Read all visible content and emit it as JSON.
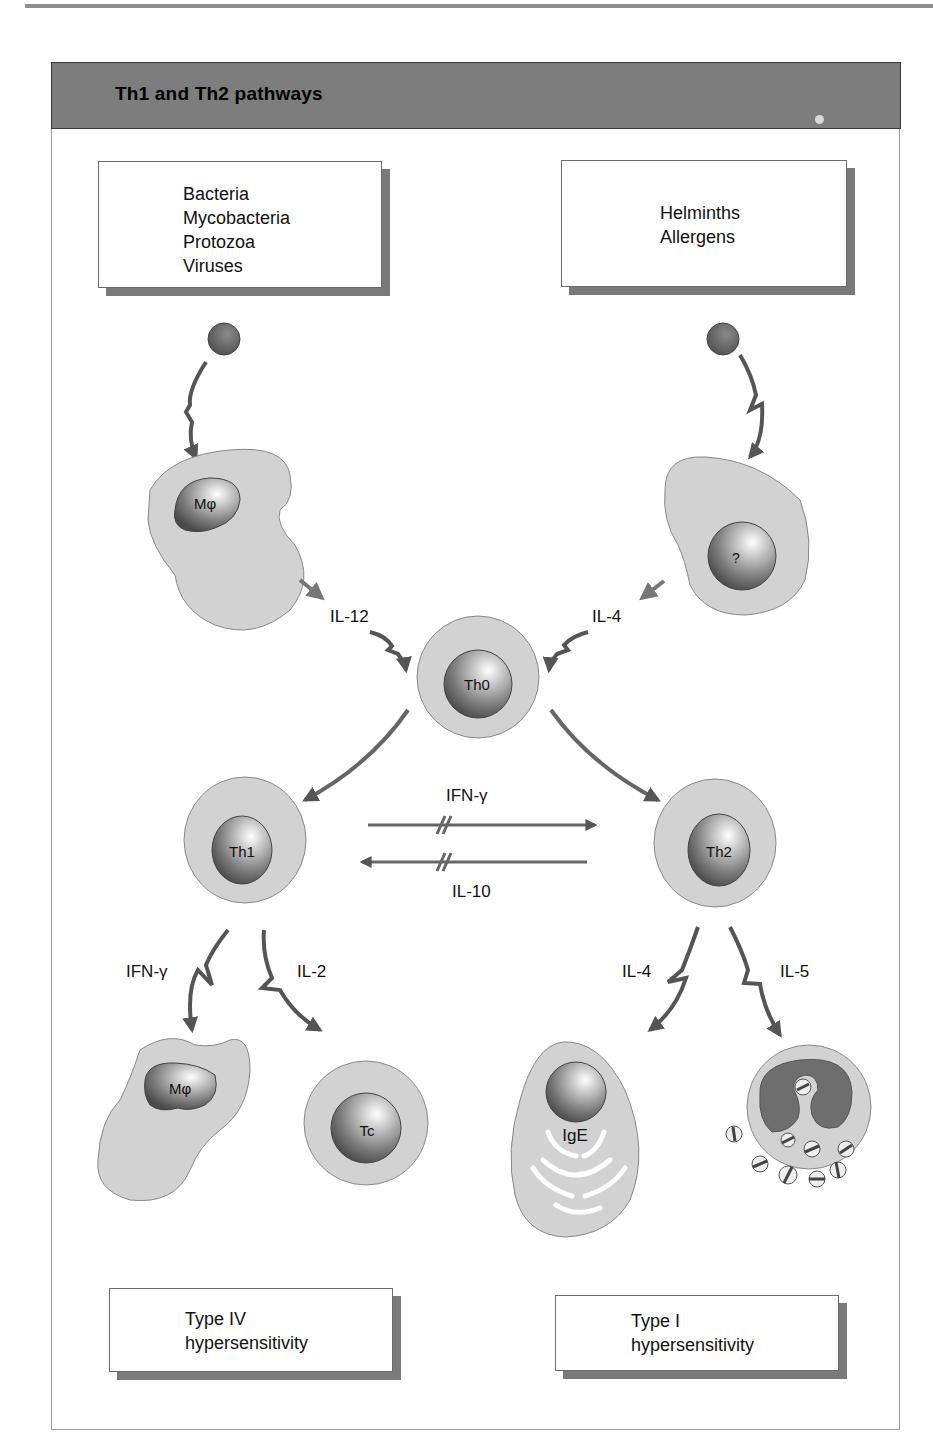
{
  "figure": {
    "title": "Th1 and Th2 pathways"
  },
  "boxes": {
    "top_left": {
      "lines": [
        "Bacteria",
        "Mycobacteria",
        "Protozoa",
        "Viruses"
      ]
    },
    "top_right": {
      "lines": [
        "Helminths",
        "Allergens"
      ]
    },
    "bottom_left": {
      "lines": [
        "Type IV",
        "hypersensitivity"
      ]
    },
    "bottom_right": {
      "lines": [
        "Type I",
        "hypersensitivity"
      ]
    }
  },
  "cells": {
    "macrophage_top": "Mφ",
    "unknown_cell": "?",
    "th0": "Th0",
    "th1": "Th1",
    "th2": "Th2",
    "macrophage_bottom": "Mφ",
    "tc": "Tc",
    "b_cell": "IgE"
  },
  "cytokines": {
    "il12": "IL-12",
    "il4_top": "IL-4",
    "ifn_gamma_cross": "IFN-γ",
    "il10_cross": "IL-10",
    "ifn_gamma_th1": "IFN-γ",
    "il2": "IL-2",
    "il4_th2": "IL-4",
    "il5": "IL-5"
  },
  "colors": {
    "header_bg": "#7d7d7d",
    "cell_fill": "#d0d0d0",
    "nucleus_dark": "#5a5a5a",
    "arrow": "#555555",
    "shadow": "#7a7a7a"
  }
}
